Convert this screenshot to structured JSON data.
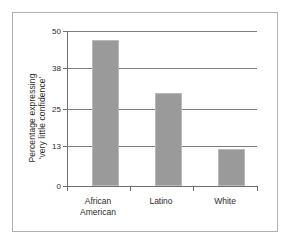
{
  "chart_data": {
    "type": "bar",
    "title": "",
    "subtitle": "",
    "xlabel": "",
    "ylabel": "Percentage expressing 'very little confidence'",
    "ylabel_lines": [
      "Percentage expressing",
      "'very little confidence'"
    ],
    "categories": [
      "African American",
      "Latino",
      "White"
    ],
    "category_lines": [
      [
        "African",
        "American"
      ],
      [
        "Latino"
      ],
      [
        "White"
      ]
    ],
    "values": [
      47,
      30,
      12
    ],
    "ylim": [
      0,
      50
    ],
    "yticks": [
      0,
      13,
      25,
      38,
      50
    ],
    "ytick_labels": [
      "0",
      "13",
      "25",
      "38",
      "50"
    ],
    "grid": true,
    "grid_axis": "y",
    "legend": false,
    "bar_color": "#9a9a9a",
    "bar_edge_color": "#b9b9b9",
    "axis_color": "#6f6f6f",
    "grid_color": "#7d7d7d",
    "frame_color": "#b0b0b0",
    "background": "#ffffff",
    "text_color": "#2b2b2b"
  }
}
